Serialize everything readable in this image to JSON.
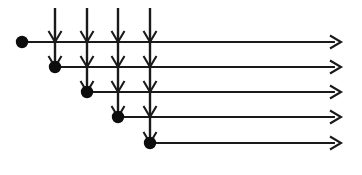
{
  "diagram": {
    "canvas": {
      "width": 362,
      "height": 175,
      "background": "#ffffff"
    },
    "style": {
      "line_color": "#1a1a1a",
      "dot_color": "#0d0d0d",
      "line_width": 2.1,
      "vertical_line_width": 2.4,
      "dot_radius": 6.2,
      "arrow_half_width": 6.5,
      "arrow_length": 11,
      "arrow_stroke": 2.1
    },
    "columns": [
      {
        "name": "column-1",
        "x": 55
      },
      {
        "name": "column-2",
        "x": 87
      },
      {
        "name": "column-3",
        "x": 118
      },
      {
        "name": "column-4",
        "x": 150
      }
    ],
    "rows": [
      {
        "name": "row-1",
        "y": 42
      },
      {
        "name": "row-2",
        "y": 67
      },
      {
        "name": "row-3",
        "y": 92
      },
      {
        "name": "row-4",
        "y": 117
      },
      {
        "name": "row-5",
        "y": 143
      }
    ],
    "nodes": [
      {
        "name": "node-1",
        "x": 22,
        "y": 42
      },
      {
        "name": "node-2",
        "x": 55,
        "y": 67
      },
      {
        "name": "node-3",
        "x": 87,
        "y": 92
      },
      {
        "name": "node-4",
        "x": 118,
        "y": 117
      },
      {
        "name": "node-5",
        "x": 150,
        "y": 143
      }
    ],
    "horizontal_arrows": [
      {
        "name": "horizontal-arrow-1",
        "x1": 22,
        "x2": 341,
        "y": 42
      },
      {
        "name": "horizontal-arrow-2",
        "x1": 55,
        "x2": 341,
        "y": 67
      },
      {
        "name": "horizontal-arrow-3",
        "x1": 87,
        "x2": 341,
        "y": 92
      },
      {
        "name": "horizontal-arrow-4",
        "x1": 118,
        "x2": 341,
        "y": 117
      },
      {
        "name": "horizontal-arrow-5",
        "x1": 150,
        "x2": 341,
        "y": 143
      }
    ],
    "vertical_arrows": [
      {
        "name": "vertical-arrow-1",
        "x": 55,
        "y1": 8,
        "y2": 67
      },
      {
        "name": "vertical-arrow-2",
        "x": 87,
        "y1": 8,
        "y2": 92
      },
      {
        "name": "vertical-arrow-3",
        "x": 118,
        "y1": 8,
        "y2": 117
      },
      {
        "name": "vertical-arrow-4",
        "x": 150,
        "y1": 8,
        "y2": 143
      }
    ],
    "crossing_arrowheads": [
      {
        "name": "crossing-arrowhead-c1-r1",
        "x": 55,
        "y": 42
      },
      {
        "name": "crossing-arrowhead-c1-r2",
        "x": 55,
        "y": 67
      },
      {
        "name": "crossing-arrowhead-c2-r1",
        "x": 87,
        "y": 42
      },
      {
        "name": "crossing-arrowhead-c2-r2",
        "x": 87,
        "y": 67
      },
      {
        "name": "crossing-arrowhead-c2-r3",
        "x": 87,
        "y": 92
      },
      {
        "name": "crossing-arrowhead-c3-r1",
        "x": 118,
        "y": 42
      },
      {
        "name": "crossing-arrowhead-c3-r2",
        "x": 118,
        "y": 67
      },
      {
        "name": "crossing-arrowhead-c3-r3",
        "x": 118,
        "y": 92
      },
      {
        "name": "crossing-arrowhead-c3-r4",
        "x": 118,
        "y": 117
      },
      {
        "name": "crossing-arrowhead-c4-r1",
        "x": 150,
        "y": 42
      },
      {
        "name": "crossing-arrowhead-c4-r2",
        "x": 150,
        "y": 67
      },
      {
        "name": "crossing-arrowhead-c4-r3",
        "x": 150,
        "y": 92
      },
      {
        "name": "crossing-arrowhead-c4-r4",
        "x": 150,
        "y": 117
      },
      {
        "name": "crossing-arrowhead-c4-r5",
        "x": 150,
        "y": 143
      }
    ]
  }
}
